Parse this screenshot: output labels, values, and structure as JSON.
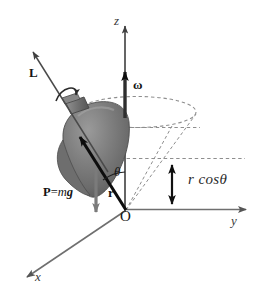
{
  "figure": {
    "type": "physics-diagram",
    "background_color": "#ffffff",
    "width": 273,
    "height": 295
  },
  "axes": {
    "z": {
      "label": "z",
      "direction": "up",
      "color": "#4a4a4a"
    },
    "y": {
      "label": "y",
      "direction": "right",
      "color": "#6a6a6a"
    },
    "x": {
      "label": "x",
      "direction": "down-left",
      "color": "#6a6a6a"
    },
    "origin": {
      "label": "O"
    }
  },
  "vectors": {
    "angular_momentum": {
      "label": "L",
      "style": "bold",
      "description": "angular momentum vector along the top's symmetry axis"
    },
    "angular_velocity": {
      "label": "ω",
      "style": "bold",
      "description": "precession angular velocity along +z"
    },
    "position": {
      "label": "r",
      "style": "bold",
      "description": "position vector from O to the centre of mass"
    },
    "weight": {
      "label": "P=mg",
      "parts": {
        "p": "P",
        "equals": "=",
        "m": "m",
        "g": "g"
      },
      "description": "weight force acting downward at the centre of mass"
    }
  },
  "annotations": {
    "angle": {
      "label": "θ",
      "description": "tilt angle between the top's axis and the vertical z axis"
    },
    "height": {
      "label": "r cosθ",
      "description": "vertical height of the centre of mass above the origin"
    },
    "spin": {
      "label": "spin-arrow",
      "description": "curved arrow showing the top spinning about its own axis"
    },
    "precession_circle": {
      "label": "precession-ellipse",
      "description": "dashed ellipse traced by the top's axis as it precesses"
    },
    "cone": {
      "label": "precession-cone",
      "description": "dashed cone generated by the precessing symmetry axis"
    }
  },
  "colors": {
    "axis_dark": "#4a4a4a",
    "axis_light": "#6f6f6f",
    "dashed": "#8a8a8a",
    "top_body_light": "#8f8f8f",
    "top_body_mid": "#767676",
    "top_body_dark": "#5d5d5d",
    "vector_black": "#111111",
    "weight_gray": "#7b7b7b",
    "text": "#141414"
  }
}
